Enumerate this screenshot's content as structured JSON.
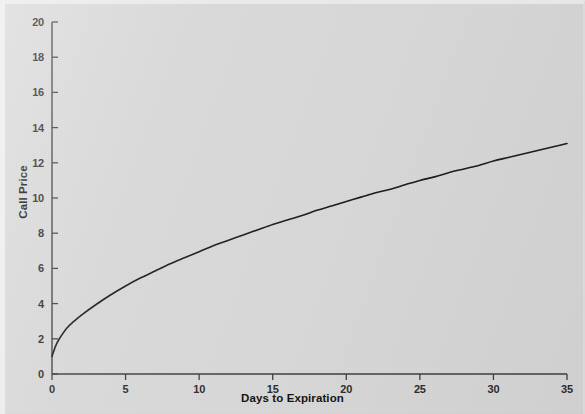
{
  "figure": {
    "background_color": "#d9d9d9",
    "ink_color": "#1a1a1a",
    "axis_color": "#404040"
  },
  "axes": {
    "x_title": "Days to Expiration",
    "y_title": "Call Price",
    "x_ticks": [
      "0",
      "5",
      "10",
      "15",
      "20",
      "25",
      "30",
      "35"
    ],
    "y_ticks": [
      "0",
      "2",
      "4",
      "6",
      "8",
      "10",
      "12",
      "14",
      "16",
      "18",
      "20"
    ]
  },
  "chart_data": {
    "type": "line",
    "title": "",
    "subtitle": "",
    "xlabel": "Days to Expiration",
    "ylabel": "Call Price",
    "xlim": [
      0,
      35
    ],
    "ylim": [
      0,
      20
    ],
    "xticks": [
      0,
      5,
      10,
      15,
      20,
      25,
      30,
      35
    ],
    "yticks": [
      0,
      2,
      4,
      6,
      8,
      10,
      12,
      14,
      16,
      18,
      20
    ],
    "grid": false,
    "legend": null,
    "legend_position": "none",
    "annotations": [],
    "series": [
      {
        "name": "Call Price",
        "color": "#1a1a1a",
        "line_width": 1.6,
        "x": [
          0,
          0.25,
          0.5,
          1,
          1.5,
          2,
          3,
          4,
          5,
          6,
          7,
          8,
          9,
          10,
          11,
          12,
          13,
          14,
          15,
          16,
          17,
          18,
          19,
          20,
          21,
          22,
          23,
          24,
          25,
          26,
          27,
          28,
          29,
          30,
          31,
          32,
          33,
          34,
          35
        ],
        "y": [
          1.0,
          1.6,
          2.0,
          2.6,
          3.0,
          3.35,
          3.95,
          4.5,
          5.0,
          5.45,
          5.85,
          6.25,
          6.6,
          6.95,
          7.3,
          7.6,
          7.9,
          8.2,
          8.5,
          8.75,
          9.0,
          9.3,
          9.55,
          9.8,
          10.05,
          10.3,
          10.5,
          10.75,
          11.0,
          11.2,
          11.45,
          11.65,
          11.85,
          12.1,
          12.3,
          12.5,
          12.7,
          12.9,
          13.1
        ]
      }
    ]
  }
}
